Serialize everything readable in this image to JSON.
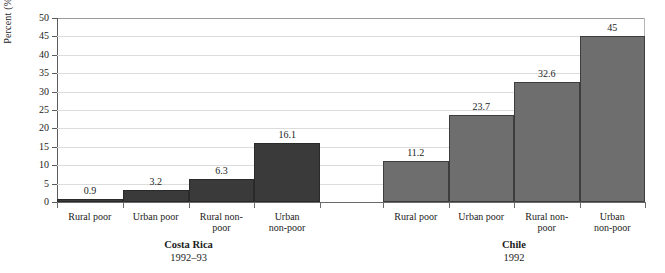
{
  "chart_data": {
    "type": "bar",
    "title": "",
    "xlabel": "",
    "ylabel": "Percent (%)",
    "ylim": [
      0,
      50
    ],
    "ytick_values": [
      0,
      5,
      10,
      15,
      20,
      25,
      30,
      35,
      40,
      45,
      50
    ],
    "ytick_labels": [
      "0",
      "5",
      "10",
      "15",
      "20",
      "25",
      "30",
      "35",
      "40",
      "45",
      "50"
    ],
    "grid": true,
    "legend": "none",
    "groups": [
      {
        "name": "Costa Rica",
        "period": "1992–93",
        "color": "#3a3a3a",
        "categories": [
          "Rural poor",
          "Urban poor",
          "Rural non-\npoor",
          "Urban\nnon-poor"
        ],
        "values": [
          0.9,
          3.2,
          6.3,
          16.1
        ],
        "value_labels": [
          "0.9",
          "3.2",
          "6.3",
          "16.1"
        ]
      },
      {
        "name": "Chile",
        "period": "1992",
        "color": "#6e6e6e",
        "categories": [
          "Rural poor",
          "Urban poor",
          "Rural non-\npoor",
          "Urban\nnon-poor"
        ],
        "values": [
          11.2,
          23.7,
          32.6,
          45
        ],
        "value_labels": [
          "11.2",
          "23.7",
          "32.6",
          "45"
        ]
      }
    ]
  },
  "colors": {
    "bar_dark": "#3a3a3a",
    "bar_mid": "#6e6e6e",
    "axis": "#5a5a5a",
    "grid": "#dcdcdc",
    "text": "#1c1c1c",
    "background": "#ffffff"
  }
}
